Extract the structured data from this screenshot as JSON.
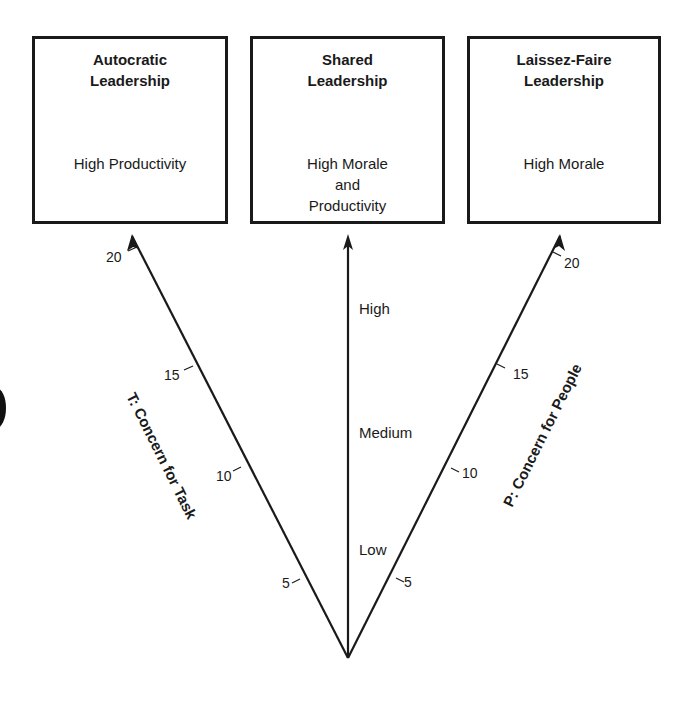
{
  "boxes": [
    {
      "title_line1": "Autocratic",
      "title_line2": "Leadership",
      "desc": [
        "High Productivity"
      ]
    },
    {
      "title_line1": "Shared",
      "title_line2": "Leadership",
      "desc": [
        "High Morale",
        "and",
        "Productivity"
      ]
    },
    {
      "title_line1": "Laissez-Faire",
      "title_line2": "Leadership",
      "desc": [
        "High Morale"
      ]
    }
  ],
  "axes": {
    "left": {
      "title": "T: Concern for Task",
      "ticks": [
        "20",
        "15",
        "10",
        "5"
      ]
    },
    "right": {
      "title": "P: Concern for People",
      "ticks": [
        "20",
        "15",
        "10",
        "5"
      ]
    },
    "center": {
      "levels": [
        "High",
        "Medium",
        "Low"
      ]
    }
  },
  "colors": {
    "line": "#1a1a1a",
    "background": "#ffffff"
  }
}
